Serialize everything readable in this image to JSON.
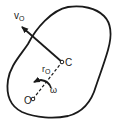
{
  "diagram": {
    "type": "rigid-body-kinematics",
    "labels": {
      "velocity": "v",
      "velocity_sub": "O",
      "center": "C",
      "radius": "r",
      "radius_sub": "O",
      "angular_velocity": "ω",
      "origin": "O"
    },
    "colors": {
      "stroke": "#1a1a1a",
      "background": "#ffffff"
    }
  }
}
